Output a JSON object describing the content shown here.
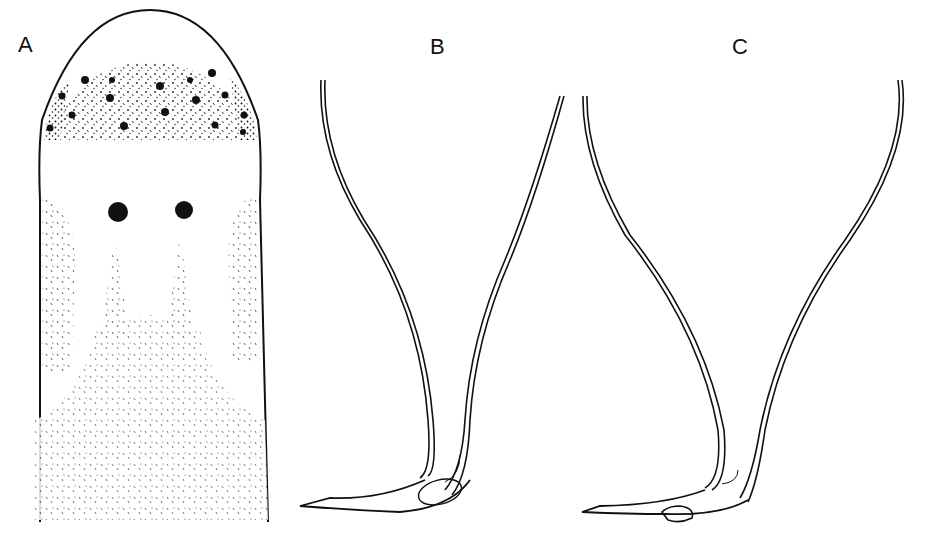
{
  "figure": {
    "panels": [
      {
        "label": "A",
        "subject": "head-region-with-eyespots"
      },
      {
        "label": "B",
        "subject": "stylet-apparatus"
      },
      {
        "label": "C",
        "subject": "stylet-apparatus"
      }
    ]
  },
  "colors": {
    "ink": "#111111",
    "background": "#ffffff"
  }
}
